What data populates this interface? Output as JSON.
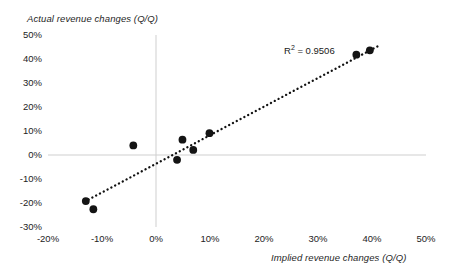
{
  "chart_data": {
    "type": "scatter",
    "title": "",
    "xlabel": "Implied revenue changes (Q/Q)",
    "ylabel": "Actual revenue changes (Q/Q)",
    "xlim": [
      -20,
      50
    ],
    "ylim": [
      -30,
      50
    ],
    "xticks": [
      "-20%",
      "-10%",
      "0%",
      "10%",
      "20%",
      "30%",
      "40%",
      "50%"
    ],
    "xtick_values": [
      -20,
      -10,
      0,
      10,
      20,
      30,
      40,
      50
    ],
    "yticks": [
      "50%",
      "40%",
      "30%",
      "20%",
      "10%",
      "0%",
      "-10%",
      "-20%",
      "-30%"
    ],
    "ytick_values": [
      50,
      40,
      30,
      20,
      10,
      0,
      -10,
      -20,
      -30
    ],
    "grid": false,
    "zero_lines": true,
    "legend": "none",
    "marker_color": "#141414",
    "zero_line_color": "#cfcfcf",
    "trendline": {
      "style": "dotted",
      "color": "#111111",
      "x_start": -13.2,
      "y_start": -19.4,
      "x_end": 41.0,
      "y_end": 45.2
    },
    "annotations": [
      {
        "name": "r-squared",
        "prefix": "R",
        "superscript": "2",
        "suffix": " = 0.9506",
        "x": 26.5,
        "y": 45.5
      }
    ],
    "points": [
      {
        "x": -13.0,
        "y": -19.2
      },
      {
        "x": -11.6,
        "y": -22.6
      },
      {
        "x": -4.2,
        "y": 4.0
      },
      {
        "x": 3.9,
        "y": -2.0
      },
      {
        "x": 4.9,
        "y": 6.4
      },
      {
        "x": 6.9,
        "y": 2.1
      },
      {
        "x": 9.9,
        "y": 9.1
      },
      {
        "x": 37.1,
        "y": 41.8
      },
      {
        "x": 39.6,
        "y": 43.6
      }
    ]
  }
}
